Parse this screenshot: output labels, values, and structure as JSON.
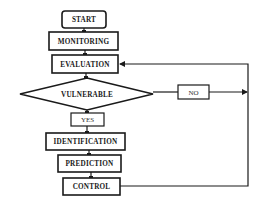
{
  "diagram": {
    "type": "flowchart",
    "nodes": {
      "start": {
        "label": "START",
        "shape": "rounded-rect"
      },
      "monitoring": {
        "label": "MONITORING",
        "shape": "rect"
      },
      "evaluation": {
        "label": "EVALUATION",
        "shape": "rect"
      },
      "vulnerable": {
        "label": "VULNERABLE",
        "shape": "diamond"
      },
      "no": {
        "label": "NO",
        "shape": "rect"
      },
      "yes": {
        "label": "YES",
        "shape": "rect"
      },
      "identification": {
        "label": "IDENTIFICATION",
        "shape": "rect"
      },
      "prediction": {
        "label": "PREDICTION",
        "shape": "rect"
      },
      "control": {
        "label": "CONTROL",
        "shape": "rect"
      }
    },
    "edges": [
      {
        "from": "START",
        "to": "MONITORING"
      },
      {
        "from": "MONITORING",
        "to": "EVALUATION"
      },
      {
        "from": "EVALUATION",
        "to": "VULNERABLE"
      },
      {
        "from": "VULNERABLE",
        "to": "NO"
      },
      {
        "from": "NO",
        "to": "EVALUATION",
        "via": "right feedback loop"
      },
      {
        "from": "VULNERABLE",
        "to": "YES"
      },
      {
        "from": "YES",
        "to": "IDENTIFICATION"
      },
      {
        "from": "IDENTIFICATION",
        "to": "PREDICTION"
      },
      {
        "from": "PREDICTION",
        "to": "CONTROL"
      },
      {
        "from": "CONTROL",
        "to": "EVALUATION",
        "via": "right feedback loop"
      }
    ],
    "colors": {
      "stroke": "#1a1a1a",
      "background": "#ffffff"
    }
  }
}
